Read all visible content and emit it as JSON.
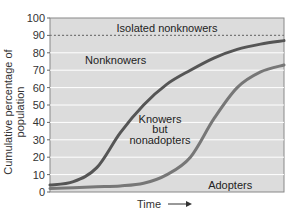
{
  "chart_data": {
    "type": "line",
    "title": "",
    "xlabel": "Time",
    "ylabel": "Cumulative percentage of population",
    "ylim": [
      0,
      100
    ],
    "yticks": [
      0,
      10,
      20,
      30,
      40,
      50,
      60,
      70,
      80,
      90,
      100
    ],
    "grid": true,
    "x": [
      0,
      10,
      20,
      30,
      40,
      50,
      60,
      70,
      80,
      90,
      100
    ],
    "series": [
      {
        "name": "Knowers (Nonknowers boundary)",
        "values": [
          4,
          6,
          14,
          34,
          50,
          62,
          70,
          77,
          82,
          85,
          87
        ],
        "color": "#555555"
      },
      {
        "name": "Adopters (Knowers but nonadopters boundary)",
        "values": [
          2,
          2.5,
          3,
          3.5,
          5,
          10,
          20,
          42,
          60,
          69,
          73
        ],
        "color": "#777777"
      },
      {
        "name": "Isolated nonknowers threshold",
        "values": [
          90,
          90,
          90,
          90,
          90,
          90,
          90,
          90,
          90,
          90,
          90
        ],
        "style": "dotted",
        "color": "#777777"
      }
    ],
    "annotations": [
      {
        "text": "Isolated nonknowers",
        "x": 50,
        "y": 94
      },
      {
        "text": "Nonknowers",
        "x": 15,
        "y": 76
      },
      {
        "text": "Knowers",
        "x": 47,
        "y": 42
      },
      {
        "text": "but",
        "x": 47,
        "y": 36
      },
      {
        "text": "nonadopters",
        "x": 47,
        "y": 30
      },
      {
        "text": "Adopters",
        "x": 77,
        "y": 4
      }
    ],
    "legend": "none"
  },
  "labels": {
    "ylabel": "Cumulative percentage of population",
    "xlabel": "Time"
  },
  "colors": {
    "plot_bg": "#dcdcdc",
    "gridline": "#ffffff",
    "knowers_curve": "#4a4a4a",
    "adopters_curve": "#707070"
  }
}
